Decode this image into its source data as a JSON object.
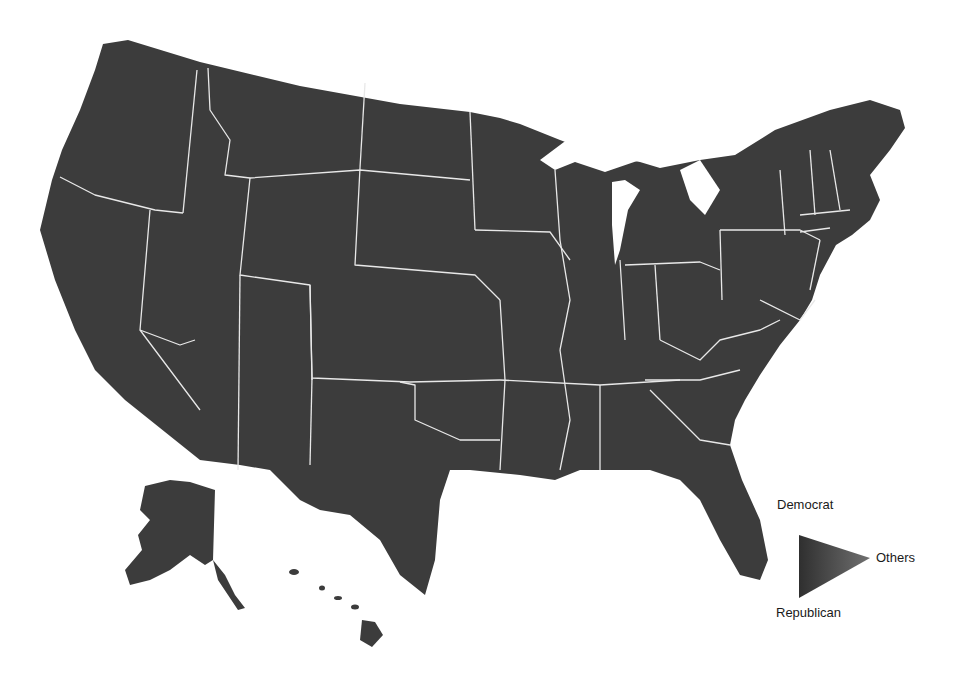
{
  "map": {
    "title": "US county-level vote share map",
    "region": "United States (counties)",
    "insets": [
      "Alaska",
      "Hawaii"
    ],
    "fill_color": "#3c3c3c",
    "border_color": "#e8e8e8",
    "background": "#ffffff"
  },
  "legend": {
    "type": "ternary-triangle",
    "top_label": "Democrat",
    "right_label": "Others",
    "bottom_label": "Republican",
    "colors": {
      "democrat": "#2e2e2e",
      "republican": "#3a3a3a",
      "others": "#6a6a6a"
    }
  }
}
